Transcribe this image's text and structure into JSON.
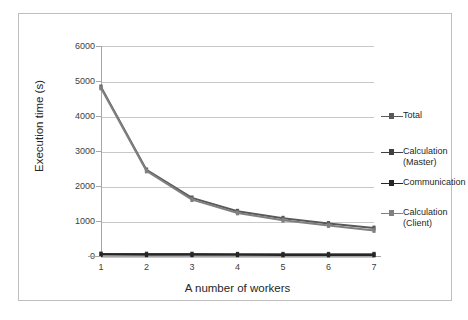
{
  "chart_data": {
    "type": "line",
    "title": "",
    "xlabel": "A number of workers",
    "ylabel": "Execution time (s)",
    "x": [
      1,
      2,
      3,
      4,
      5,
      6,
      7
    ],
    "categories": [
      "1",
      "2",
      "3",
      "4",
      "5",
      "6",
      "7"
    ],
    "xtick_labels": [
      "1",
      "2",
      "3",
      "4",
      "5",
      "6",
      "7"
    ],
    "ytick_labels": [
      "0",
      "1000",
      "2000",
      "3000",
      "4000",
      "5000",
      "6000"
    ],
    "ytick_values": [
      0,
      1000,
      2000,
      3000,
      4000,
      5000,
      6000
    ],
    "ylim": [
      0,
      6000
    ],
    "xlim": [
      1,
      7
    ],
    "grid": "horizontal",
    "legend_position": "right",
    "series": [
      {
        "name": "Total",
        "color": "#595959",
        "values": [
          4830,
          2460,
          1660,
          1280,
          1080,
          930,
          800
        ]
      },
      {
        "name": "Calculation\n(Master)",
        "color": "#404040",
        "values": [
          60,
          55,
          55,
          50,
          50,
          50,
          50
        ]
      },
      {
        "name": "Communication",
        "color": "#262626",
        "values": [
          40,
          35,
          35,
          35,
          30,
          30,
          30
        ]
      },
      {
        "name": "Calculation\n(Client)",
        "color": "#808080",
        "values": [
          4800,
          2430,
          1610,
          1230,
          1020,
          870,
          730
        ]
      }
    ]
  },
  "legend": {
    "entries": [
      {
        "label": "Total",
        "color": "#595959"
      },
      {
        "label": "Calculation\n(Master)",
        "color": "#404040"
      },
      {
        "label": "Communication",
        "color": "#262626"
      },
      {
        "label": "Calculation\n(Client)",
        "color": "#808080"
      }
    ]
  },
  "axes": {
    "y_title": "Execution time (s)",
    "x_title": "A number of workers",
    "y_ticks": [
      "6000",
      "5000",
      "4000",
      "3000",
      "2000",
      "1000",
      "0"
    ],
    "x_ticks": [
      "1",
      "2",
      "3",
      "4",
      "5",
      "6",
      "7"
    ]
  },
  "colors": {
    "frame_border": "#bfbfbf",
    "gridline": "#c8c8c8",
    "axis": "#a6a6a6",
    "text": "#262626",
    "background": "#ffffff"
  }
}
